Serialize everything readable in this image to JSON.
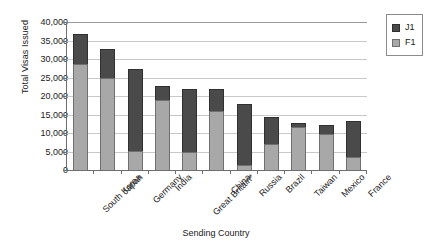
{
  "chart_data": {
    "type": "bar",
    "stacked": true,
    "title": "",
    "xlabel": "Sending Country",
    "ylabel": "Total Visas Issued",
    "ylim": [
      0,
      40000
    ],
    "ytick_labels": [
      "40,000",
      "35,000",
      "30,000",
      "25,000",
      "20,000",
      "15,000",
      "10,000",
      "5,000",
      "0"
    ],
    "ytick_values": [
      40000,
      35000,
      30000,
      25000,
      20000,
      15000,
      10000,
      5000,
      0
    ],
    "grid": "horizontal",
    "legend_position": "top-right",
    "categories": [
      "South Korea",
      "Japan",
      "Germany",
      "India",
      "Great Britain*",
      "China",
      "Russia",
      "Brazil",
      "Taiwan",
      "Mexico",
      "France"
    ],
    "series": [
      {
        "name": "F1",
        "color": "#a8a8a8",
        "values": [
          28600,
          24800,
          5200,
          19000,
          4800,
          16000,
          1300,
          7000,
          11600,
          9600,
          3600
        ]
      },
      {
        "name": "J1",
        "color": "#4a4a4a",
        "values": [
          8200,
          7900,
          22000,
          3800,
          17200,
          6000,
          16500,
          7300,
          1100,
          2600,
          9700
        ]
      }
    ],
    "totals": [
      36800,
      32700,
      27200,
      22800,
      22000,
      22000,
      17800,
      14300,
      12700,
      12200,
      13300
    ]
  },
  "legend": {
    "entries": [
      {
        "label": "J1",
        "color": "#4a4a4a"
      },
      {
        "label": "F1",
        "color": "#a8a8a8"
      }
    ]
  }
}
